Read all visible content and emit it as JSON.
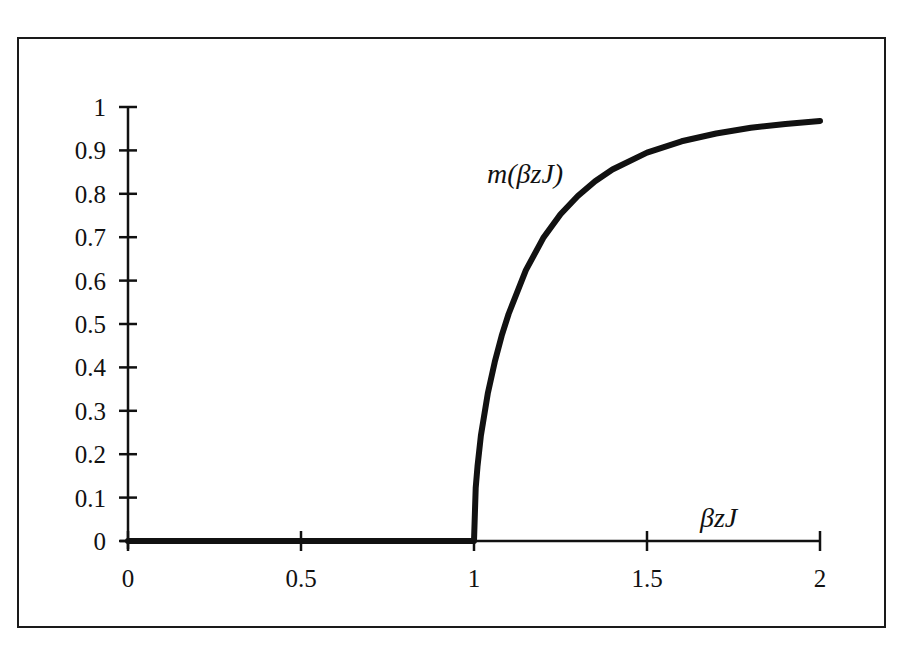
{
  "chart_data": {
    "type": "line",
    "title": "",
    "xlabel": "βzJ",
    "ylabel": "",
    "xlim": [
      0,
      2
    ],
    "ylim": [
      0,
      1
    ],
    "grid": false,
    "legend": "none",
    "x_ticks": [
      "0",
      "0.5",
      "1",
      "1.5",
      "2"
    ],
    "y_ticks": [
      "0",
      "0.1",
      "0.2",
      "0.3",
      "0.4",
      "0.5",
      "0.6",
      "0.7",
      "0.8",
      "0.9",
      "1"
    ],
    "annotations": [
      {
        "text": "m(βzJ)",
        "x": 1.05,
        "y": 0.87
      },
      {
        "text": "βzJ",
        "x": 1.75,
        "y": 0.04
      }
    ],
    "series": [
      {
        "name": "m(βzJ)",
        "x": [
          0,
          0.5,
          1.0,
          1.005,
          1.01,
          1.02,
          1.04,
          1.06,
          1.08,
          1.1,
          1.15,
          1.2,
          1.25,
          1.3,
          1.35,
          1.4,
          1.5,
          1.6,
          1.7,
          1.8,
          1.9,
          2.0
        ],
        "values": [
          0,
          0,
          0,
          0.122,
          0.172,
          0.243,
          0.34,
          0.413,
          0.473,
          0.523,
          0.624,
          0.698,
          0.753,
          0.795,
          0.829,
          0.856,
          0.895,
          0.921,
          0.939,
          0.952,
          0.961,
          0.968
        ]
      }
    ]
  }
}
